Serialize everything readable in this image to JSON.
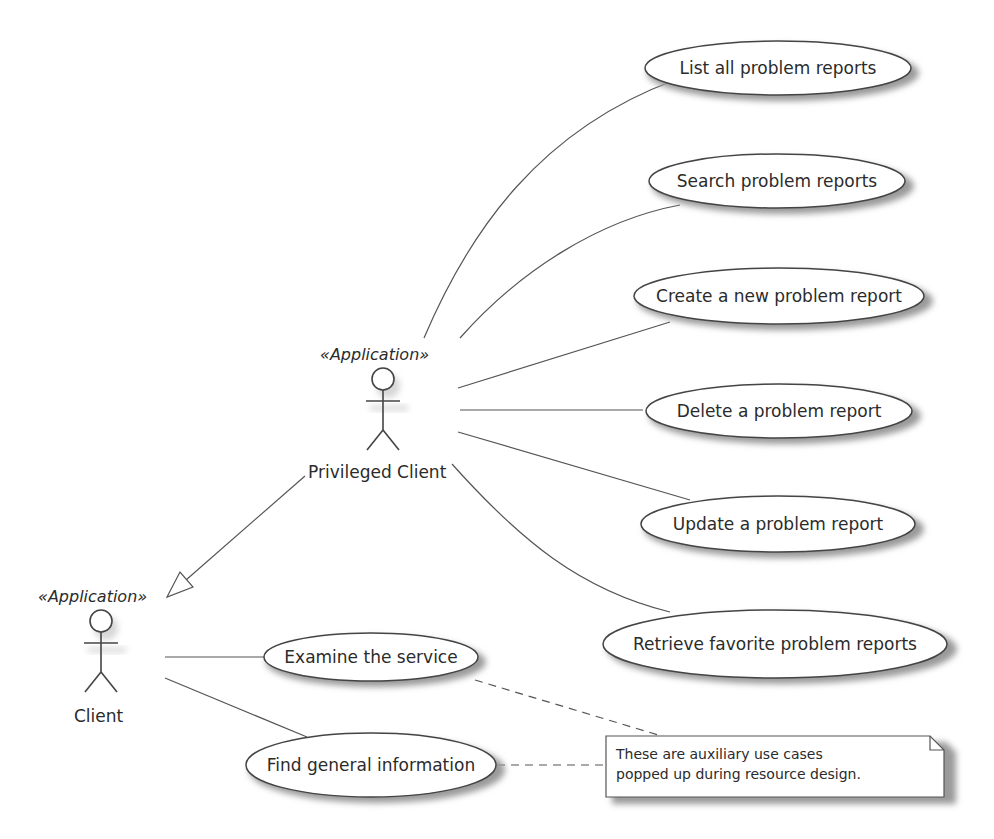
{
  "diagram": {
    "type": "uml-use-case",
    "actors": [
      {
        "id": "privileged_client",
        "name": "Privileged Client",
        "stereotype": "«Application»"
      },
      {
        "id": "client",
        "name": "Client",
        "stereotype": "«Application»"
      }
    ],
    "use_cases": [
      {
        "id": "uc1",
        "label": "List all problem reports",
        "actor": "privileged_client"
      },
      {
        "id": "uc2",
        "label": "Search problem reports",
        "actor": "privileged_client"
      },
      {
        "id": "uc3",
        "label": "Create a new problem report",
        "actor": "privileged_client"
      },
      {
        "id": "uc4",
        "label": "Delete a problem report",
        "actor": "privileged_client"
      },
      {
        "id": "uc5",
        "label": "Update a problem report",
        "actor": "privileged_client"
      },
      {
        "id": "uc6",
        "label": "Retrieve favorite problem reports",
        "actor": "privileged_client"
      },
      {
        "id": "uc7",
        "label": "Examine the service",
        "actor": "client"
      },
      {
        "id": "uc8",
        "label": "Find general information",
        "actor": "client"
      }
    ],
    "generalization": {
      "from": "privileged_client",
      "to": "client"
    },
    "note": {
      "lines": [
        "These are auxiliary use cases",
        "popped up during resource design."
      ],
      "attached_to": [
        "uc7",
        "uc8"
      ]
    }
  },
  "colors": {
    "line": "#555555",
    "text": "#2b2b2b",
    "shadow": "#9a9a9a",
    "background": "#ffffff"
  }
}
